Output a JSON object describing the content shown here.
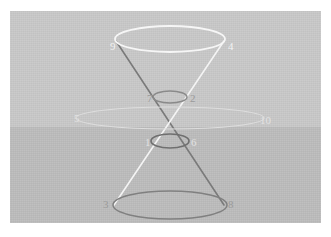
{
  "figure": {
    "background": {
      "plate_color": "#c9c9c9",
      "lower_band_color": "#bdbdbd",
      "page_color": "#ffffff"
    },
    "colors": {
      "white_line": "#f4f4f4",
      "dark_line": "#7a7a7a",
      "mid_line": "#8f8f8f",
      "faint_line": "#e0e0e0"
    },
    "labels": [
      {
        "id": "label-1",
        "text": "1",
        "x": 135,
        "y": 133,
        "tone": "faint"
      },
      {
        "id": "label-2",
        "text": "2",
        "x": 180,
        "y": 89,
        "tone": "mid"
      },
      {
        "id": "label-3",
        "text": "3",
        "x": 93,
        "y": 192,
        "tone": "mid"
      },
      {
        "id": "label-4",
        "text": "4",
        "x": 218,
        "y": 30,
        "tone": "white"
      },
      {
        "id": "label-5",
        "text": "5",
        "x": 64,
        "y": 111,
        "tone": "faint"
      },
      {
        "id": "label-6",
        "text": "6",
        "x": 181,
        "y": 133,
        "tone": "faint"
      },
      {
        "id": "label-7",
        "text": "7",
        "x": 137,
        "y": 89,
        "tone": "mid"
      },
      {
        "id": "label-8",
        "text": "8",
        "x": 218,
        "y": 192,
        "tone": "mid"
      },
      {
        "id": "label-9",
        "text": "9",
        "x": 100,
        "y": 30,
        "tone": "white"
      },
      {
        "id": "label-10",
        "text": "10",
        "x": 250,
        "y": 113,
        "tone": "faint"
      }
    ],
    "elements": {
      "top_ellipse": "top-circle-section",
      "upper_small_ellipse": "upper-ellipse-section",
      "wide_ellipse": "horizontal-plane-section",
      "lower_small_ellipse": "lower-ellipse-section",
      "bottom_ellipse": "bottom-circle-section",
      "left_generator": "cone-generator-left",
      "right_generator": "cone-generator-right"
    }
  }
}
